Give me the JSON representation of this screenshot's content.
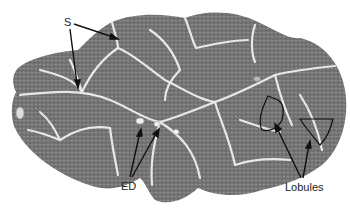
{
  "figure": {
    "colors": {
      "background": "#ffffff",
      "tissue": "#7a7a7a",
      "tissue_dark": "#5e5e5e",
      "septa": "#e6e6e6",
      "annotation": "#111111"
    },
    "labels": {
      "septa": "S",
      "excretory_ducts": "ED",
      "lobules": "Lobules"
    }
  }
}
